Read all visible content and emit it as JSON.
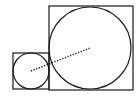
{
  "diagram": {
    "stroke_color": "#1a1a1a",
    "background": "#ffffff",
    "small_square": {
      "x": 13,
      "y": 53,
      "size": 36
    },
    "small_circle": {
      "cx": 31,
      "cy": 71,
      "r": 18
    },
    "large_square": {
      "x": 49,
      "y": 6,
      "size": 84
    },
    "large_circle": {
      "cx": 90,
      "cy": 48,
      "r": 41
    },
    "center_line": {
      "x1": 31,
      "y1": 71,
      "x2": 90,
      "y2": 48,
      "style": "dotted"
    }
  }
}
